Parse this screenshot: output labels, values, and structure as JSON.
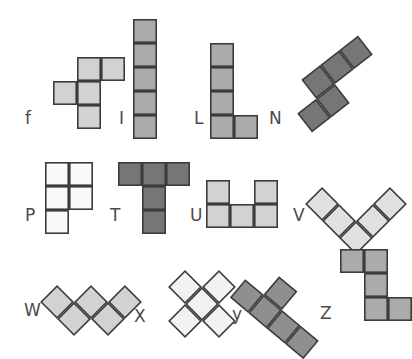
{
  "figure": {
    "type": "pentomino-chart",
    "background_color": "#ffffff",
    "cell_size": 24,
    "stroke_color": "#3c3c3c",
    "stroke_width": 1.6,
    "label_color": "#4a4a4a"
  },
  "palette": {
    "very_light": "#fafafa",
    "light": "#e0e0e0",
    "medium_light": "#d2d2d2",
    "medium": "#ababab",
    "dark": "#767676"
  },
  "pieces": [
    {
      "id": "f",
      "label": "f",
      "label_x": 25,
      "label_y": 110,
      "origin_x": 53,
      "origin_y": 57,
      "cells": [
        [
          1,
          0
        ],
        [
          2,
          0
        ],
        [
          0,
          1
        ],
        [
          1,
          1
        ],
        [
          1,
          2
        ]
      ],
      "rotation": 0,
      "fill": "#d2d2d2"
    },
    {
      "id": "I",
      "label": "I",
      "label_x": 119,
      "label_y": 110,
      "origin_x": 133,
      "origin_y": 19,
      "cells": [
        [
          0,
          0
        ],
        [
          0,
          1
        ],
        [
          0,
          2
        ],
        [
          0,
          3
        ],
        [
          0,
          4
        ]
      ],
      "rotation": 0,
      "fill": "#ababab"
    },
    {
      "id": "L",
      "label": "L",
      "label_x": 194,
      "label_y": 110,
      "origin_x": 210,
      "origin_y": 43,
      "cells": [
        [
          0,
          0
        ],
        [
          0,
          1
        ],
        [
          0,
          2
        ],
        [
          0,
          3
        ],
        [
          1,
          3
        ]
      ],
      "rotation": 0,
      "fill": "#ababab"
    },
    {
      "id": "N",
      "label": "N",
      "label_x": 269,
      "label_y": 110,
      "origin_x": 287,
      "origin_y": 60,
      "cells": [
        [
          0,
          1
        ],
        [
          1,
          1
        ],
        [
          1,
          0
        ],
        [
          2,
          0
        ],
        [
          3,
          0
        ]
      ],
      "rotation": -38,
      "fill": "#767676"
    },
    {
      "id": "P",
      "label": "P",
      "label_x": 25,
      "label_y": 207,
      "origin_x": 45,
      "origin_y": 162,
      "cells": [
        [
          0,
          0
        ],
        [
          1,
          0
        ],
        [
          0,
          1
        ],
        [
          1,
          1
        ],
        [
          0,
          2
        ]
      ],
      "rotation": 0,
      "fill": "#fafafa"
    },
    {
      "id": "T",
      "label": "T",
      "label_x": 110,
      "label_y": 207,
      "origin_x": 118,
      "origin_y": 162,
      "cells": [
        [
          0,
          0
        ],
        [
          1,
          0
        ],
        [
          2,
          0
        ],
        [
          1,
          1
        ],
        [
          1,
          2
        ]
      ],
      "rotation": 0,
      "fill": "#767676"
    },
    {
      "id": "U",
      "label": "U",
      "label_x": 190,
      "label_y": 207,
      "origin_x": 206,
      "origin_y": 180,
      "cells": [
        [
          0,
          0
        ],
        [
          2,
          0
        ],
        [
          0,
          1
        ],
        [
          1,
          1
        ],
        [
          2,
          1
        ]
      ],
      "rotation": 0,
      "fill": "#d2d2d2"
    },
    {
      "id": "V",
      "label": "V",
      "label_x": 293,
      "label_y": 207,
      "origin_x": 320,
      "origin_y": 168,
      "cells": [
        [
          0,
          0
        ],
        [
          0,
          1
        ],
        [
          0,
          2
        ],
        [
          1,
          2
        ],
        [
          2,
          2
        ]
      ],
      "rotation": -45,
      "fill": "#e0e0e0"
    },
    {
      "id": "W",
      "label": "W",
      "label_x": 24,
      "label_y": 302,
      "origin_x": 55,
      "origin_y": 266,
      "cells": [
        [
          0,
          0
        ],
        [
          0,
          1
        ],
        [
          1,
          1
        ],
        [
          1,
          2
        ],
        [
          2,
          2
        ]
      ],
      "rotation": -45,
      "fill": "#d2d2d2"
    },
    {
      "id": "X",
      "label": "X",
      "label_x": 134,
      "label_y": 308,
      "origin_x": 166,
      "origin_y": 268,
      "cells": [
        [
          1,
          0
        ],
        [
          0,
          1
        ],
        [
          1,
          1
        ],
        [
          2,
          1
        ],
        [
          1,
          2
        ]
      ],
      "rotation": 45,
      "fill": "#f2f2f2"
    },
    {
      "id": "y",
      "label": "y",
      "label_x": 232,
      "label_y": 306,
      "origin_x": 258,
      "origin_y": 262,
      "cells": [
        [
          0,
          0
        ],
        [
          0,
          1
        ],
        [
          0,
          2
        ],
        [
          0,
          3
        ],
        [
          1,
          1
        ]
      ],
      "rotation": -50,
      "fill": "#8f8f8f"
    },
    {
      "id": "Z",
      "label": "Z",
      "label_x": 320,
      "label_y": 305,
      "origin_x": 340,
      "origin_y": 249,
      "cells": [
        [
          0,
          0
        ],
        [
          1,
          0
        ],
        [
          1,
          1
        ],
        [
          1,
          2
        ],
        [
          2,
          2
        ]
      ],
      "rotation": 0,
      "fill": "#ababab"
    }
  ]
}
